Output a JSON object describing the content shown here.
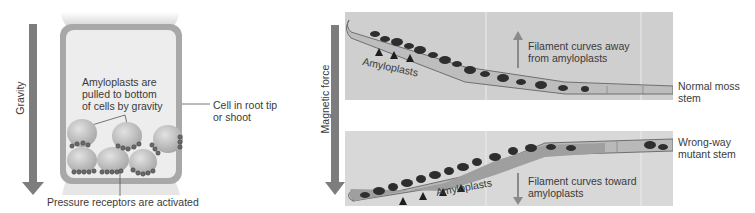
{
  "left_panel": {
    "force_label": "Gravity",
    "callout_amyloplasts": [
      "Amyloplasts are",
      "pulled to bottom",
      "of cells by gravity"
    ],
    "callout_cell": [
      "Cell in root tip",
      "or shoot"
    ],
    "callout_receptors": "Pressure receptors are activated"
  },
  "right_panel": {
    "force_label": "Magnetic force",
    "top_image": {
      "amyloplasts_label": "Amyloplasts",
      "curve_label": [
        "Filament curves away",
        "from amyloplasts"
      ],
      "side_label": [
        "Normal moss",
        "stem"
      ]
    },
    "bottom_image": {
      "amyloplasts_label": "Amyloplasts",
      "curve_label": [
        "Filament curves toward",
        "amyloplasts"
      ],
      "side_label": [
        "Wrong-way",
        "mutant stem"
      ]
    }
  },
  "colors": {
    "arrow": "#7d7d7d",
    "cell_wall": "#a8a8a8",
    "cell_fill": "#ededed",
    "amyloplast": "#bdbdbd",
    "receptor": "#555555",
    "photo_bg": "#cfcfcf",
    "filament_dark": "#2e2e2e"
  }
}
